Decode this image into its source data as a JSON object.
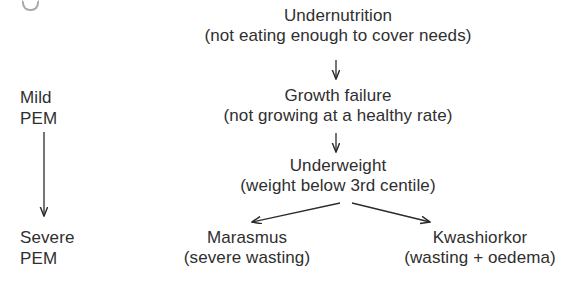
{
  "diagram": {
    "background_color": "#ffffff",
    "text_color": "#2f2f2f",
    "line_color": "#2b2b2b",
    "nodes": {
      "undernutrition": {
        "title": "Undernutrition",
        "sub": "(not eating enough to cover needs)"
      },
      "growth_failure": {
        "title": "Growth failure",
        "sub": "(not growing at a healthy rate)"
      },
      "underweight": {
        "title": "Underweight",
        "sub": "(weight below 3rd centile)"
      },
      "marasmus": {
        "title": "Marasmus",
        "sub": "(severe wasting)"
      },
      "kwashiorkor": {
        "title": "Kwashiorkor",
        "sub": "(wasting + oedema)"
      },
      "mild_pem": {
        "title": "Mild",
        "sub": "PEM"
      },
      "severe_pem": {
        "title": "Severe",
        "sub": "PEM"
      }
    },
    "arrows": [
      {
        "name": "undernutrition-to-growth-failure",
        "direction": "down"
      },
      {
        "name": "growth-failure-to-underweight",
        "direction": "down"
      },
      {
        "name": "underweight-to-marasmus",
        "direction": "down-left"
      },
      {
        "name": "underweight-to-kwashiorkor",
        "direction": "down-right"
      },
      {
        "name": "mild-pem-to-severe-pem",
        "direction": "down"
      }
    ]
  }
}
